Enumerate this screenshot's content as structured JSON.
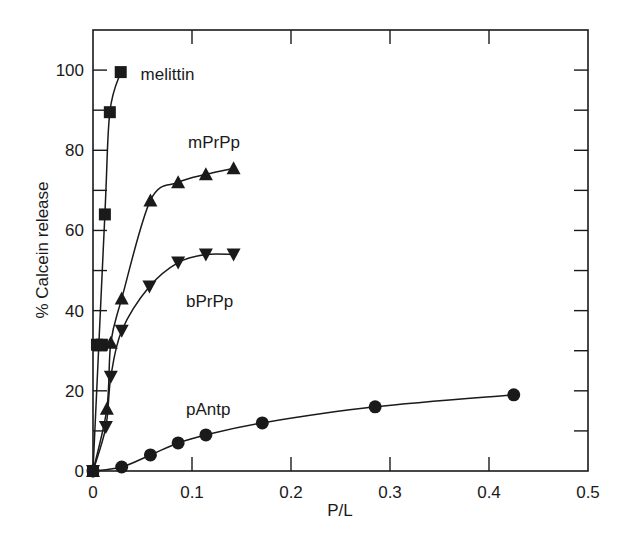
{
  "chart_data": {
    "type": "line",
    "title": "",
    "xlabel": "P/L",
    "ylabel": "% Calcein release",
    "xlim": [
      0,
      0.5
    ],
    "ylim": [
      0,
      110
    ],
    "xticks": [
      0,
      0.1,
      0.2,
      0.3,
      0.4,
      0.5
    ],
    "xtick_labels": [
      "0",
      "0.1",
      "0.2",
      "0.3",
      "0.4",
      "0.5"
    ],
    "yticks": [
      0,
      20,
      40,
      60,
      80,
      100
    ],
    "ytick_labels": [
      "0",
      "20",
      "40",
      "60",
      "80",
      "100"
    ],
    "grid": false,
    "legend_position": "inline labels",
    "series": [
      {
        "name": "melittin",
        "marker": "square",
        "label_pos": [
          0.048,
          99
        ],
        "x": [
          0,
          0.004,
          0.009,
          0.012,
          0.017,
          0.028
        ],
        "y": [
          0,
          31.5,
          31.5,
          64,
          89.5,
          99.5
        ]
      },
      {
        "name": "mPrPp",
        "marker": "triangle-up",
        "label_pos": [
          0.096,
          82
        ],
        "x": [
          0,
          0.014,
          0.018,
          0.029,
          0.058,
          0.086,
          0.114,
          0.142
        ],
        "y": [
          0,
          15.5,
          32,
          43,
          67.5,
          72,
          74,
          75.5
        ]
      },
      {
        "name": "bPrPp",
        "marker": "triangle-down",
        "label_pos": [
          0.094,
          42.5
        ],
        "x": [
          0,
          0.013,
          0.018,
          0.029,
          0.057,
          0.086,
          0.114,
          0.142
        ],
        "y": [
          0,
          11,
          23.5,
          35,
          46,
          52,
          54,
          54
        ]
      },
      {
        "name": "pAntp",
        "marker": "circle",
        "label_pos": [
          0.094,
          15.5
        ],
        "x": [
          0,
          0.029,
          0.058,
          0.086,
          0.114,
          0.171,
          0.285,
          0.425
        ],
        "y": [
          0,
          1,
          4,
          7,
          9,
          12,
          16,
          19
        ]
      }
    ]
  },
  "colors": {
    "ink": "#1a1a1a",
    "background": "#ffffff"
  }
}
